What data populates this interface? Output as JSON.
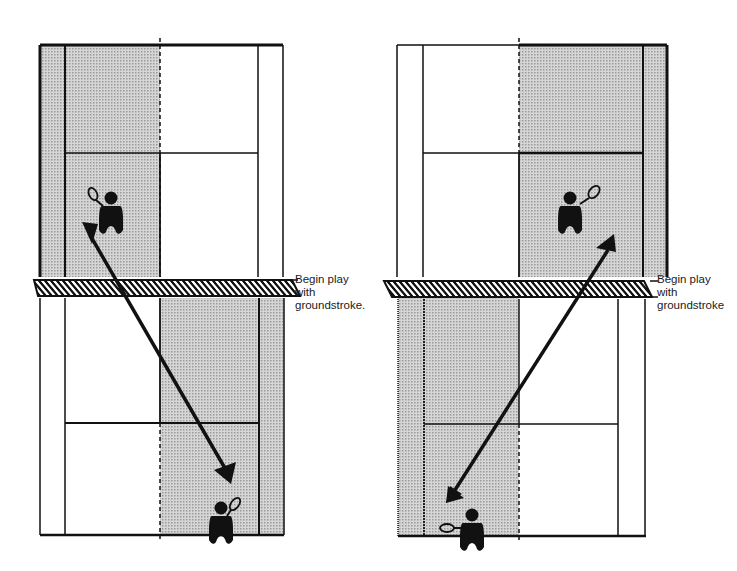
{
  "diagram": {
    "type": "tennis-drill",
    "panels": [
      {
        "id": "left",
        "caption_lines": [
          "Begin play",
          "with",
          "groundstroke."
        ],
        "shaded_zones": [
          "far court: left half of singles court plus left alley (ad side)",
          "near court: right half of singles court plus right alley (deuce side)"
        ],
        "shot_direction": "crosscourt from far-left to near-right"
      },
      {
        "id": "right",
        "caption_lines": [
          "Begin play",
          "with",
          "groundstroke"
        ],
        "shaded_zones": [
          "far court: right half of singles court plus right alley",
          "near court: left half of singles court plus left alley"
        ],
        "shot_direction": "crosscourt from far-right to near-left"
      }
    ],
    "colors": {
      "ink": "#111111",
      "shade": "#c8c8c8",
      "background": "#ffffff"
    }
  }
}
